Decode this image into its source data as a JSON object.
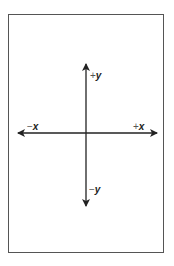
{
  "diagram": {
    "type": "coordinate-axes",
    "labels": {
      "pos_y": {
        "sign": "+",
        "var": "y"
      },
      "neg_y": {
        "sign": "−",
        "var": "y"
      },
      "pos_x": {
        "sign": "+",
        "var": "x"
      },
      "neg_x": {
        "sign": "−",
        "var": "x"
      }
    },
    "colors": {
      "axis": "#222222",
      "frame": "#555555"
    }
  }
}
